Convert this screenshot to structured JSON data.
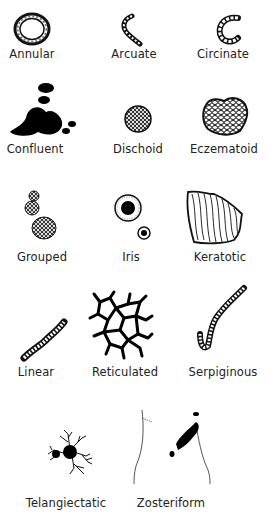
{
  "figure": {
    "items": [
      {
        "label": "Annular",
        "icon": "annular-ring-icon"
      },
      {
        "label": "Arcuate",
        "icon": "arcuate-arc-icon"
      },
      {
        "label": "Circinate",
        "icon": "circinate-c-icon"
      },
      {
        "label": "Confluent",
        "icon": "confluent-blotch-icon"
      },
      {
        "label": "Dischoid",
        "icon": "dischoid-disc-icon"
      },
      {
        "label": "Eczematoid",
        "icon": "eczematoid-patch-icon"
      },
      {
        "label": "Grouped",
        "icon": "grouped-clusters-icon"
      },
      {
        "label": "Iris",
        "icon": "iris-target-icon"
      },
      {
        "label": "Keratotic",
        "icon": "keratotic-plaque-icon"
      },
      {
        "label": "Linear",
        "icon": "linear-band-icon"
      },
      {
        "label": "Reticulated",
        "icon": "reticulated-net-icon"
      },
      {
        "label": "Serpiginous",
        "icon": "serpiginous-snake-icon"
      },
      {
        "label": "Telangiectatic",
        "icon": "telangiectatic-spider-icon"
      },
      {
        "label": "Zosteriform",
        "icon": "zosteriform-torso-icon"
      }
    ]
  }
}
